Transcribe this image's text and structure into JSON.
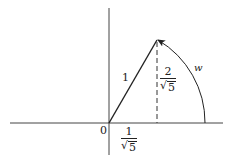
{
  "diagram": {
    "type": "unit-vector-rotation",
    "colors": {
      "stroke": "#222222",
      "background": "#ffffff"
    },
    "origin_label": "0",
    "vector_length_label": "1",
    "arc_label": "w",
    "x_component": {
      "numerator": "1",
      "radical": "√",
      "radicand": "5"
    },
    "y_component": {
      "numerator": "2",
      "radical": "√",
      "radicand": "5"
    }
  }
}
